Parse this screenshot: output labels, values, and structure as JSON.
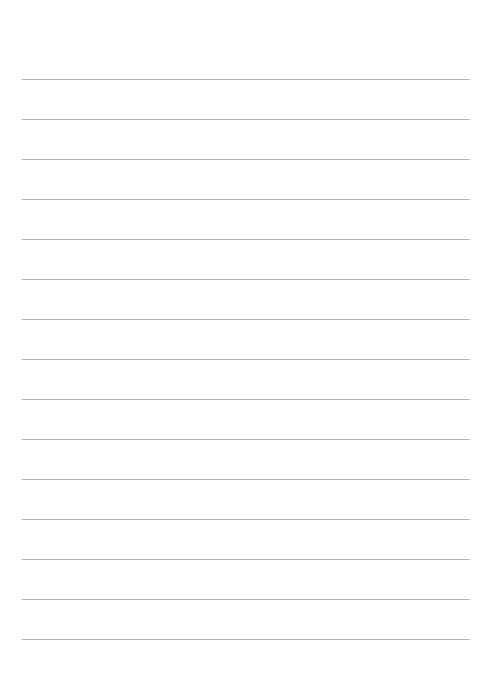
{
  "page": {
    "type": "lined-paper",
    "line_count": 15,
    "line_start_y": 79,
    "line_spacing": 40,
    "line_color": "#b5b5b5",
    "background": "#ffffff"
  }
}
